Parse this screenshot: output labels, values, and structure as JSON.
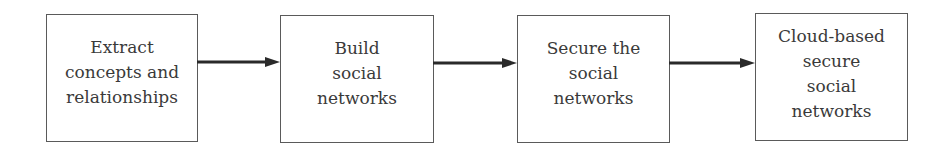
{
  "diagram": {
    "type": "flowchart",
    "direction": "left-to-right",
    "colors": {
      "border": "#5a5a5a",
      "text": "#3a3a3a",
      "arrow": "#2a2a2a",
      "background": "#ffffff"
    },
    "nodes": [
      {
        "id": "1",
        "label": "Extract\nconcepts and\nrelationships"
      },
      {
        "id": "2",
        "label": "Build\nsocial\nnetworks"
      },
      {
        "id": "3",
        "label": "Secure the\nsocial\nnetworks"
      },
      {
        "id": "4",
        "label": "Cloud-based\nsecure\nsocial\nnetworks"
      }
    ],
    "edges": [
      {
        "from": "1",
        "to": "2",
        "icon": "arrow-right-icon"
      },
      {
        "from": "2",
        "to": "3",
        "icon": "arrow-right-icon"
      },
      {
        "from": "3",
        "to": "4",
        "icon": "arrow-right-icon"
      }
    ]
  }
}
